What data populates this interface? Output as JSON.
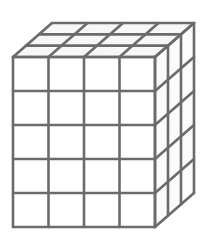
{
  "diagram": {
    "type": "isometric-cuboid-of-unit-cubes",
    "dimensions": {
      "width": 4,
      "height": 5,
      "depth": 3
    },
    "unit_cube_count": 60,
    "colors": {
      "line": "#6b6b6b",
      "background": "#ffffff"
    },
    "geometry": {
      "front_origin": [
        13,
        57
      ],
      "cell_w": 35.5,
      "cell_h": 34,
      "depth_dx": 13,
      "depth_dy": -11.33
    }
  }
}
